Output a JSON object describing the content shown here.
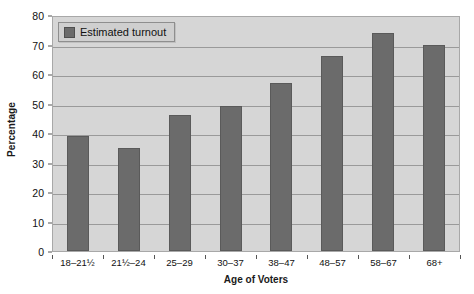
{
  "chart_data": {
    "type": "bar",
    "title": "",
    "xlabel": "Age of Voters",
    "ylabel": "Percentage",
    "categories": [
      "18–21½",
      "21½–24",
      "25–29",
      "30–37",
      "38–47",
      "48–57",
      "58–67",
      "68+"
    ],
    "values": [
      39,
      35,
      46,
      49,
      57,
      66,
      74,
      70
    ],
    "series": [
      {
        "name": "Estimated turnout",
        "values": [
          39,
          35,
          46,
          49,
          57,
          66,
          74,
          70
        ],
        "color": "#6b6b6b"
      }
    ],
    "ylim": [
      0,
      80
    ],
    "ytick_step": 10,
    "yticks": [
      80,
      70,
      60,
      50,
      40,
      30,
      20,
      10,
      0
    ],
    "grid": true,
    "legend": {
      "position": "top-left",
      "entries": [
        {
          "label": "Estimated turnout",
          "swatch_color": "#6b6b6b"
        }
      ]
    },
    "plot_background": "#d6d6d6",
    "gridline_color": "#9a9a9a",
    "bar_color": "#6b6b6b"
  },
  "axes": {
    "y_title": "Percentage",
    "x_title": "Age of Voters"
  },
  "legend": {
    "label": "Estimated turnout"
  }
}
